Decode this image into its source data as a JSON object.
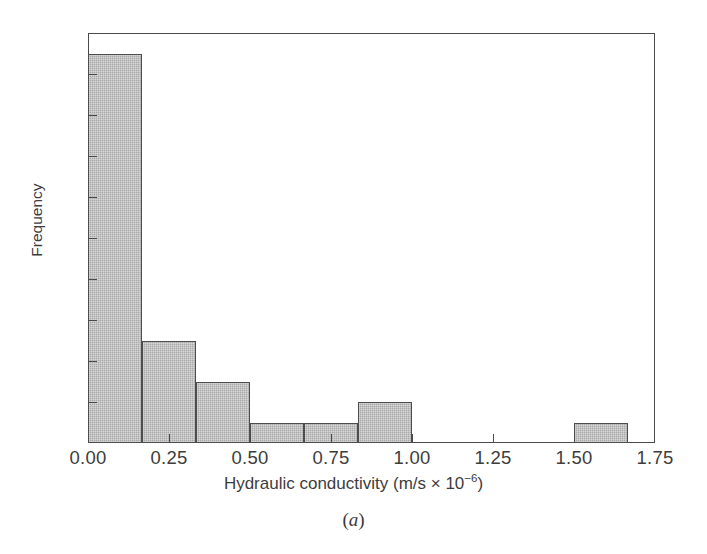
{
  "figure": {
    "caption_open": "(",
    "caption_letter": "a",
    "caption_close": ")"
  },
  "axes": {
    "xlabel_main": "Hydraulic conductivity (m/s × 10",
    "xlabel_exponent": "−6",
    "xlabel_tail": ")",
    "ylabel": "Frequency"
  },
  "chart_data": {
    "type": "bar",
    "title": "",
    "subtitle": "",
    "xlabel": "Hydraulic conductivity (m/s × 10−6)",
    "ylabel": "Frequency",
    "xlim": [
      0.0,
      1.75
    ],
    "ylim": [
      0,
      20
    ],
    "xticks": [
      "0.00",
      "0.25",
      "0.50",
      "0.75",
      "1.00",
      "1.25",
      "1.50",
      "1.75"
    ],
    "xtick_values": [
      0.0,
      0.25,
      0.5,
      0.75,
      1.0,
      1.25,
      1.5,
      1.75
    ],
    "yticks": [
      "0",
      "2",
      "4",
      "6",
      "8",
      "10",
      "12",
      "14",
      "16",
      "18",
      "20"
    ],
    "ytick_values": [
      0,
      2,
      4,
      6,
      8,
      10,
      12,
      14,
      16,
      18,
      20
    ],
    "grid": false,
    "legend": null,
    "bin_width": 0.1667,
    "bin_edges": [
      0.0,
      0.1667,
      0.3333,
      0.5,
      0.6667,
      0.8333,
      1.0,
      1.1667,
      1.3333,
      1.5,
      1.6667
    ],
    "categories": [
      "0.00–0.17",
      "0.17–0.33",
      "0.33–0.50",
      "0.50–0.67",
      "0.67–0.83",
      "0.83–1.00",
      "1.00–1.17",
      "1.17–1.33",
      "1.33–1.50",
      "1.50–1.67"
    ],
    "values": [
      19,
      5,
      3,
      1,
      1,
      2,
      0,
      0,
      0,
      1
    ],
    "bar_color": "#a9a9a9",
    "bar_edge_color": "#4d4d4d",
    "axis_color": "#4a4a4a",
    "background_color": "#ffffff",
    "total_count": 32
  }
}
